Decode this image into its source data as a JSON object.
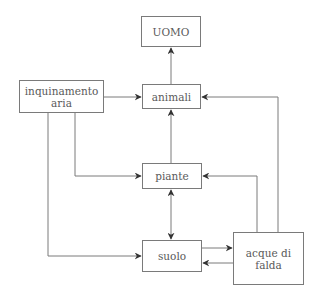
{
  "diagram": {
    "nodes": [
      {
        "id": "uomo",
        "label": "UOMO",
        "x": 141,
        "y": 16,
        "w": 60,
        "h": 31
      },
      {
        "id": "inquinamento_aria",
        "label": "inquinamento aria",
        "lines": [
          "inquinamento",
          "aria"
        ],
        "x": 19,
        "y": 80,
        "w": 85,
        "h": 33
      },
      {
        "id": "animali",
        "label": "animali",
        "x": 142,
        "y": 84,
        "w": 59,
        "h": 25
      },
      {
        "id": "piante",
        "label": "piante",
        "x": 142,
        "y": 163,
        "w": 60,
        "h": 26
      },
      {
        "id": "suolo",
        "label": "suolo",
        "x": 142,
        "y": 240,
        "w": 60,
        "h": 32
      },
      {
        "id": "acque_di_falda",
        "label": "acque di falda",
        "lines": [
          "acque di",
          "falda"
        ],
        "x": 233,
        "y": 232,
        "w": 71,
        "h": 53
      }
    ],
    "edges": [
      {
        "from": "animali",
        "to": "uomo"
      },
      {
        "from": "inquinamento_aria",
        "to": "animali"
      },
      {
        "from": "inquinamento_aria",
        "to": "piante"
      },
      {
        "from": "inquinamento_aria",
        "to": "suolo"
      },
      {
        "from": "piante",
        "to": "animali"
      },
      {
        "from": "piante",
        "to": "suolo",
        "bidirectional": true
      },
      {
        "from": "suolo",
        "to": "acque_di_falda"
      },
      {
        "from": "acque_di_falda",
        "to": "suolo"
      },
      {
        "from": "acque_di_falda",
        "to": "piante"
      },
      {
        "from": "acque_di_falda",
        "to": "animali"
      }
    ],
    "colors": {
      "line": "#7a7a7a",
      "arrow": "#333333",
      "text": "#5a5a5a"
    }
  }
}
